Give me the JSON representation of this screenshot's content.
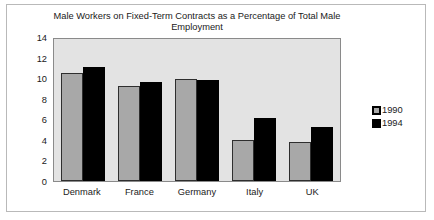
{
  "chart_data": {
    "type": "bar",
    "title": "Male Workers on Fixed-Term Contracts as a Percentage of Total Male Employment",
    "xlabel": "",
    "ylabel": "",
    "ylim": [
      0,
      14
    ],
    "yticks": [
      14,
      12,
      10,
      8,
      6,
      4,
      2,
      0
    ],
    "grid": false,
    "legend_position": "right",
    "categories": [
      "Denmark",
      "France",
      "Germany",
      "Italy",
      "UK"
    ],
    "series": [
      {
        "name": "1990",
        "color": "#a8a8a8",
        "values": [
          10.5,
          9.2,
          9.9,
          4.0,
          3.8
        ]
      },
      {
        "name": "1994",
        "color": "#000000",
        "values": [
          11.1,
          9.6,
          9.8,
          6.1,
          5.3
        ]
      }
    ]
  }
}
